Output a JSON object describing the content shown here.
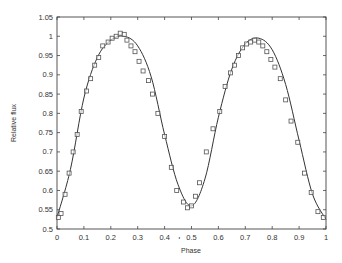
{
  "chart_data": {
    "type": "scatter",
    "title": "",
    "xlabel": "Phase",
    "ylabel": "Relative flux",
    "xlim": [
      0,
      1
    ],
    "ylim": [
      0.5,
      1.05
    ],
    "xticks": [
      "0",
      "0.1",
      "0.2",
      "0.3",
      "0.4",
      "0.5",
      "0.6",
      "0.7",
      "0.8",
      "0.9",
      "1"
    ],
    "yticks": [
      "0.5",
      "0.55",
      "0.6",
      "0.65",
      "0.7",
      "0.75",
      "0.8",
      "0.85",
      "0.9",
      "0.95",
      "1",
      "1.05"
    ],
    "grid": false,
    "legend": null,
    "series": [
      {
        "name": "observed",
        "kind": "markers",
        "marker": "square",
        "x": [
          0.005,
          0.015,
          0.03,
          0.045,
          0.06,
          0.075,
          0.09,
          0.11,
          0.125,
          0.14,
          0.155,
          0.17,
          0.19,
          0.205,
          0.22,
          0.235,
          0.25,
          0.26,
          0.275,
          0.29,
          0.305,
          0.32,
          0.34,
          0.355,
          0.375,
          0.4,
          0.425,
          0.445,
          0.47,
          0.485,
          0.5,
          0.515,
          0.53,
          0.555,
          0.58,
          0.605,
          0.625,
          0.645,
          0.66,
          0.675,
          0.69,
          0.705,
          0.72,
          0.735,
          0.75,
          0.765,
          0.78,
          0.795,
          0.81,
          0.83,
          0.85,
          0.87,
          0.895,
          0.92,
          0.945,
          0.97,
          0.99
        ],
        "y": [
          0.53,
          0.54,
          0.59,
          0.645,
          0.7,
          0.745,
          0.805,
          0.858,
          0.89,
          0.925,
          0.945,
          0.975,
          0.985,
          0.995,
          1.0,
          1.008,
          1.005,
          0.99,
          0.975,
          0.96,
          0.935,
          0.91,
          0.885,
          0.85,
          0.8,
          0.74,
          0.66,
          0.6,
          0.57,
          0.555,
          0.56,
          0.585,
          0.62,
          0.7,
          0.76,
          0.805,
          0.87,
          0.905,
          0.925,
          0.95,
          0.97,
          0.98,
          0.985,
          0.99,
          0.985,
          0.975,
          0.96,
          0.94,
          0.92,
          0.89,
          0.835,
          0.78,
          0.725,
          0.645,
          0.595,
          0.545,
          0.53
        ]
      },
      {
        "name": "model",
        "kind": "line",
        "x": [
          0,
          0.05,
          0.1,
          0.15,
          0.2,
          0.25,
          0.3,
          0.35,
          0.4,
          0.45,
          0.5,
          0.55,
          0.6,
          0.65,
          0.7,
          0.75,
          0.8,
          0.85,
          0.9,
          0.95,
          1
        ],
        "y": [
          0.53,
          0.655,
          0.84,
          0.945,
          0.99,
          1.0,
          0.975,
          0.895,
          0.745,
          0.615,
          0.56,
          0.63,
          0.79,
          0.915,
          0.98,
          0.995,
          0.965,
          0.875,
          0.73,
          0.59,
          0.525
        ]
      }
    ]
  }
}
